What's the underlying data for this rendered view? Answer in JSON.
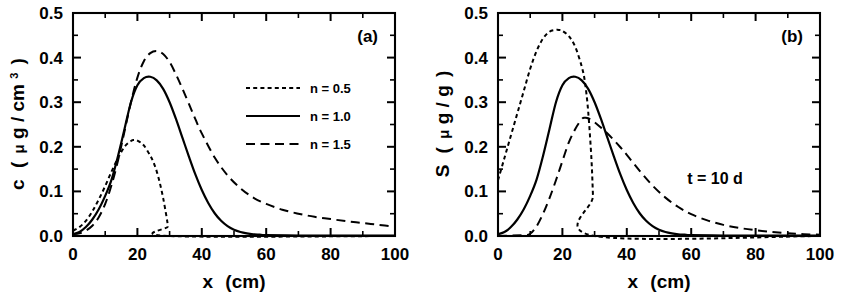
{
  "figure": {
    "background_color": "#ffffff",
    "ink_color": "#000000"
  },
  "panel_a": {
    "label": "(a)",
    "xlabel_main": "x",
    "xlabel_unit": "(cm)",
    "ylabel_symbol": "c",
    "ylabel_unit_open": "(",
    "ylabel_mu": "μ",
    "ylabel_unit_text": "g / cm",
    "ylabel_unit_sup": "3",
    "ylabel_unit_close": ")",
    "xticks": [
      "0",
      "20",
      "40",
      "60",
      "80",
      "100"
    ],
    "yticks": [
      "0.0",
      "0.1",
      "0.2",
      "0.3",
      "0.4",
      "0.5"
    ],
    "legend": [
      {
        "label": "n = 0.5",
        "style": "dotted"
      },
      {
        "label": "n = 1.0",
        "style": "solid"
      },
      {
        "label": "n = 1.5",
        "style": "dashed"
      }
    ]
  },
  "panel_b": {
    "label": "(b)",
    "xlabel_main": "x",
    "xlabel_unit": "(cm)",
    "ylabel_symbol": "S",
    "ylabel_unit_open": "(",
    "ylabel_mu": "μ",
    "ylabel_unit_text": "g / g",
    "ylabel_unit_close": ")",
    "xticks": [
      "0",
      "20",
      "40",
      "60",
      "80",
      "100"
    ],
    "yticks": [
      "0.0",
      "0.1",
      "0.2",
      "0.3",
      "0.4",
      "0.5"
    ],
    "annotation": "t = 10 d"
  },
  "chart_data": [
    {
      "type": "line",
      "panel": "(a)",
      "title": "",
      "xlabel": "x (cm)",
      "ylabel": "c ( μg / cm3 )",
      "xlim": [
        0,
        100
      ],
      "ylim": [
        0.0,
        0.5
      ],
      "xticks": [
        0,
        20,
        40,
        60,
        80,
        100
      ],
      "yticks": [
        0.0,
        0.1,
        0.2,
        0.3,
        0.4,
        0.5
      ],
      "xtick_minor_step": 10,
      "ytick_minor_step": 0.05,
      "grid": false,
      "legend_position": "upper-right-inside",
      "annotations": [
        "(a)"
      ],
      "series": [
        {
          "name": "n = 0.5",
          "style": "dotted",
          "x": [
            0,
            2,
            4,
            6,
            8,
            10,
            12,
            14,
            16,
            18,
            19,
            20,
            22,
            24,
            25,
            26,
            27,
            28,
            29,
            29.5,
            30,
            100
          ],
          "values": [
            0.012,
            0.02,
            0.034,
            0.055,
            0.082,
            0.112,
            0.145,
            0.175,
            0.2,
            0.213,
            0.215,
            0.214,
            0.203,
            0.18,
            0.165,
            0.145,
            0.118,
            0.085,
            0.045,
            0.022,
            0.0,
            0.0
          ]
        },
        {
          "name": "n = 1.0",
          "style": "solid",
          "x": [
            0,
            2,
            4,
            6,
            8,
            10,
            12,
            14,
            16,
            18,
            20,
            22,
            24,
            26,
            28,
            30,
            32,
            34,
            36,
            38,
            40,
            42,
            44,
            46,
            48,
            50,
            52,
            54,
            56,
            58,
            60,
            70,
            80,
            90,
            100
          ],
          "values": [
            0.004,
            0.009,
            0.02,
            0.037,
            0.06,
            0.09,
            0.127,
            0.18,
            0.24,
            0.3,
            0.338,
            0.354,
            0.357,
            0.349,
            0.33,
            0.3,
            0.262,
            0.22,
            0.178,
            0.138,
            0.103,
            0.074,
            0.051,
            0.034,
            0.022,
            0.014,
            0.009,
            0.006,
            0.004,
            0.003,
            0.002,
            0.001,
            0.001,
            0.001,
            0.001
          ]
        },
        {
          "name": "n = 1.5",
          "style": "dashed",
          "x": [
            0,
            2,
            4,
            6,
            8,
            10,
            12,
            14,
            16,
            18,
            20,
            22,
            24,
            26,
            28,
            30,
            32,
            34,
            36,
            38,
            40,
            44,
            48,
            52,
            56,
            60,
            65,
            70,
            75,
            80,
            85,
            90,
            95,
            100
          ],
          "values": [
            0.004,
            0.006,
            0.012,
            0.023,
            0.042,
            0.072,
            0.115,
            0.17,
            0.235,
            0.3,
            0.355,
            0.392,
            0.41,
            0.415,
            0.408,
            0.39,
            0.362,
            0.33,
            0.296,
            0.262,
            0.23,
            0.176,
            0.136,
            0.107,
            0.086,
            0.072,
            0.059,
            0.05,
            0.043,
            0.038,
            0.033,
            0.029,
            0.025,
            0.021
          ]
        }
      ]
    },
    {
      "type": "line",
      "panel": "(b)",
      "title": "",
      "xlabel": "x (cm)",
      "ylabel": "S ( μg / g )",
      "xlim": [
        0,
        100
      ],
      "ylim": [
        0.0,
        0.5
      ],
      "xticks": [
        0,
        20,
        40,
        60,
        80,
        100
      ],
      "yticks": [
        0.0,
        0.1,
        0.2,
        0.3,
        0.4,
        0.5
      ],
      "xtick_minor_step": 10,
      "ytick_minor_step": 0.05,
      "grid": false,
      "legend_position": "none",
      "annotations": [
        "(b)",
        "t = 10 d"
      ],
      "series": [
        {
          "name": "n = 0.5",
          "style": "dotted",
          "x": [
            0,
            2,
            4,
            6,
            8,
            10,
            12,
            14,
            16,
            18,
            19,
            20,
            22,
            24,
            26,
            27,
            28,
            29,
            29.5,
            30,
            100
          ],
          "values": [
            0.125,
            0.175,
            0.225,
            0.275,
            0.325,
            0.375,
            0.415,
            0.443,
            0.458,
            0.462,
            0.462,
            0.46,
            0.448,
            0.424,
            0.38,
            0.345,
            0.28,
            0.175,
            0.09,
            0.0,
            0.0
          ]
        },
        {
          "name": "n = 1.0",
          "style": "solid",
          "x": [
            0,
            2,
            4,
            6,
            8,
            10,
            12,
            14,
            16,
            18,
            20,
            22,
            24,
            26,
            28,
            30,
            32,
            34,
            36,
            38,
            40,
            42,
            44,
            46,
            48,
            50,
            52,
            54,
            56,
            58,
            60,
            70,
            80,
            90,
            100
          ],
          "values": [
            0.004,
            0.009,
            0.02,
            0.037,
            0.06,
            0.09,
            0.127,
            0.18,
            0.24,
            0.3,
            0.338,
            0.354,
            0.357,
            0.349,
            0.33,
            0.3,
            0.262,
            0.22,
            0.178,
            0.138,
            0.103,
            0.074,
            0.051,
            0.034,
            0.022,
            0.014,
            0.009,
            0.006,
            0.004,
            0.003,
            0.002,
            0.001,
            0.001,
            0.001,
            0.001
          ]
        },
        {
          "name": "n = 1.5",
          "style": "dashed",
          "x": [
            0,
            8,
            10,
            12,
            14,
            16,
            18,
            20,
            22,
            24,
            26,
            27,
            28,
            30,
            32,
            34,
            36,
            38,
            40,
            44,
            48,
            52,
            56,
            60,
            65,
            70,
            75,
            80,
            85,
            90,
            95,
            100
          ],
          "values": [
            0.0,
            0.002,
            0.005,
            0.022,
            0.05,
            0.085,
            0.125,
            0.168,
            0.21,
            0.24,
            0.262,
            0.265,
            0.264,
            0.255,
            0.243,
            0.23,
            0.215,
            0.199,
            0.182,
            0.146,
            0.113,
            0.086,
            0.065,
            0.049,
            0.035,
            0.025,
            0.018,
            0.013,
            0.009,
            0.006,
            0.004,
            0.003
          ]
        }
      ]
    }
  ]
}
